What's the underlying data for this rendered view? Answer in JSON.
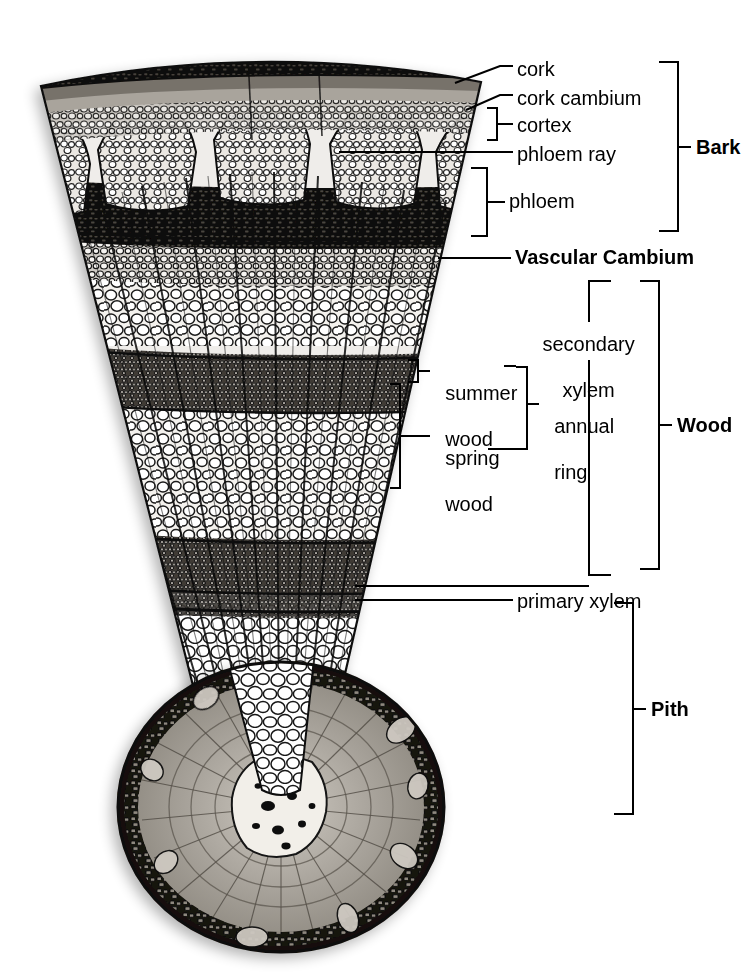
{
  "figure": {
    "kind": "woody-stem-cross-section-diagram",
    "background_color": "#ffffff",
    "ink_color": "#000000"
  },
  "labels": {
    "cork": "cork",
    "cork_cambium": "cork cambium",
    "cortex": "cortex",
    "phloem_ray": "phloem ray",
    "phloem": "phloem",
    "vascular_cambium": "Vascular Cambium",
    "secondary_xylem_line1": "secondary",
    "secondary_xylem_line2": "xylem",
    "summer_wood_line1": "summer",
    "summer_wood_line2": "wood",
    "spring_wood_line1": "spring",
    "spring_wood_line2": "wood",
    "annual_ring_line1": "annual",
    "annual_ring_line2": "ring",
    "primary_xylem": "primary xylem",
    "bark": "Bark",
    "wood": "Wood",
    "pith": "Pith"
  },
  "groups": {
    "bark": {
      "label": "Bark",
      "bracket_top": 62,
      "bracket_bottom": 231,
      "label_y": 147
    },
    "wood": {
      "label": "Wood",
      "bracket_top": 281,
      "bracket_bottom": 569,
      "label_y": 425
    },
    "pith": {
      "label": "Pith",
      "bracket_top": 603,
      "bracket_bottom": 814,
      "label_y": 709
    }
  },
  "tissues": [
    {
      "name": "cork",
      "region": "bark",
      "leader": "diagonal-pointer",
      "label_y": 70
    },
    {
      "name": "cork cambium",
      "region": "bark",
      "leader": "diagonal-pointer",
      "label_y": 99
    },
    {
      "name": "cortex",
      "region": "bark",
      "leader": "small-bracket",
      "label_y": 126
    },
    {
      "name": "phloem ray",
      "region": "bark",
      "leader": "horizontal-line",
      "label_y": 155
    },
    {
      "name": "phloem",
      "region": "bark",
      "leader": "bracket",
      "label_y": 201
    },
    {
      "name": "Vascular Cambium",
      "region": "cambium",
      "leader": "horizontal-line",
      "label_y": 258
    },
    {
      "name": "secondary xylem",
      "region": "wood",
      "leader": "open-bracket",
      "label_y": 333
    },
    {
      "name": "summer wood",
      "region": "wood",
      "leader": "small-bracket",
      "label_y": 371
    },
    {
      "name": "spring wood",
      "region": "wood",
      "leader": "bracket",
      "label_y": 434
    },
    {
      "name": "annual ring",
      "region": "wood",
      "leader": "bracket",
      "label_y": 403
    },
    {
      "name": "primary xylem",
      "region": "pith-boundary",
      "leader": "horizontal-line",
      "label_y": 602
    }
  ],
  "colors": {
    "cork_dark": "#14110f",
    "cork_cambium": "#6e6a66",
    "cortex_mid": "#3a3632",
    "phloem_pale": "#e4e1dc",
    "wood_light": "#f2f0ec",
    "wood_dark_band": "#55514c",
    "pith_pale": "#fbfaf8",
    "stem_bark_ring": "#15120f",
    "stem_wood_gray": "#9a958e",
    "stem_pith_center": "#f0ece6"
  }
}
